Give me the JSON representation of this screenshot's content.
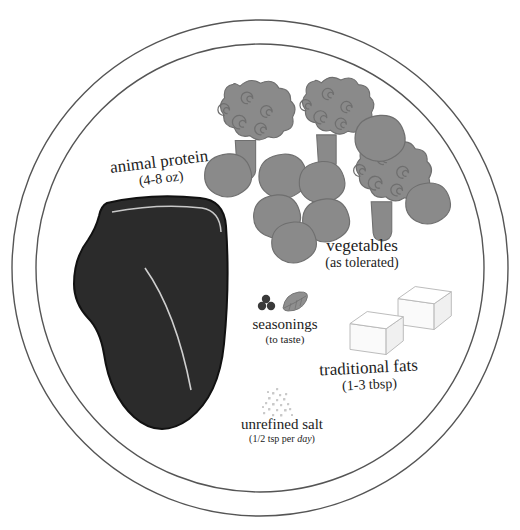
{
  "page": {
    "title": "The Ideal Meal",
    "background_color": "#ffffff"
  },
  "colors": {
    "plate_outline": "#555555",
    "vegetable_grey": "#8a8a8a",
    "vegetable_outline": "#6f6f6f",
    "meat_dark": "#2b2b2b",
    "meat_outline": "#111111",
    "fat_line": "#cfcfcf",
    "butter_fill": "#fdfdfd",
    "butter_outline": "#b8b8b8",
    "seasoning_dark": "#3a3a3a",
    "leaf_grey": "#8f8f8f",
    "salt_grey": "#c9c9c9",
    "text": "#1c1c1c"
  },
  "plate": {
    "name": "dinner-plate",
    "outer_radius": 248,
    "inner_radius": 224,
    "center_x": 260,
    "center_y": 268
  },
  "labels": [
    {
      "id": "animal-protein",
      "main": "animal protein",
      "sub": "(4-8 oz)"
    },
    {
      "id": "vegetables",
      "main": "vegetables",
      "sub": "(as tolerated)"
    },
    {
      "id": "seasonings",
      "main": "seasonings",
      "sub": "(to taste)"
    },
    {
      "id": "traditional-fats",
      "main": "traditional fats",
      "sub": "(1-3 tbsp)"
    },
    {
      "id": "unrefined-salt",
      "main": "unrefined salt",
      "sub_prefix": "(1/2 tsp per ",
      "sub_emphasis": "day",
      "sub_suffix": ")"
    }
  ],
  "food_items": {
    "broccoli_count": 3,
    "brussels_sprouts_count": 8,
    "butter_cubes_count": 2,
    "peppercorns_count": 3,
    "bay_leaves_count": 1,
    "steak_count": 1
  }
}
